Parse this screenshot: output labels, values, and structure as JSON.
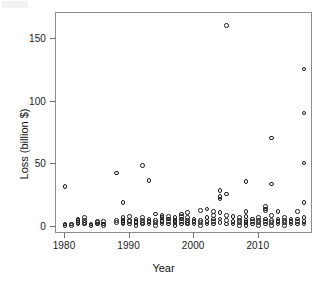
{
  "chart_data": {
    "type": "scatter",
    "title": "",
    "xlabel": "Year",
    "ylabel": "Loss (billion $)",
    "xlim": [
      1978.6,
      2018.4
    ],
    "ylim": [
      -6,
      171
    ],
    "xticks": [
      1980,
      1990,
      2000,
      2010
    ],
    "yticks": [
      0,
      50,
      100,
      150
    ],
    "xticklabels": [
      "1980",
      "1990",
      "2000",
      "2010"
    ],
    "yticklabels": [
      "0",
      "50",
      "100",
      "150"
    ],
    "grid": false,
    "legend": null,
    "marker": "open-circle",
    "marker_color": "#1c1c1c",
    "points": [
      {
        "x": 1980,
        "y": 32
      },
      {
        "x": 1980,
        "y": 2
      },
      {
        "x": 1980,
        "y": 1
      },
      {
        "x": 1981,
        "y": 2
      },
      {
        "x": 1981,
        "y": 1
      },
      {
        "x": 1982,
        "y": 3
      },
      {
        "x": 1982,
        "y": 2
      },
      {
        "x": 1982,
        "y": 6
      },
      {
        "x": 1982,
        "y": 5
      },
      {
        "x": 1983,
        "y": 7
      },
      {
        "x": 1983,
        "y": 5
      },
      {
        "x": 1983,
        "y": 3
      },
      {
        "x": 1983,
        "y": 2
      },
      {
        "x": 1984,
        "y": 2
      },
      {
        "x": 1984,
        "y": 1
      },
      {
        "x": 1985,
        "y": 4
      },
      {
        "x": 1985,
        "y": 3
      },
      {
        "x": 1985,
        "y": 2
      },
      {
        "x": 1986,
        "y": 4
      },
      {
        "x": 1986,
        "y": 2
      },
      {
        "x": 1986,
        "y": 1
      },
      {
        "x": 1988,
        "y": 43
      },
      {
        "x": 1988,
        "y": 5
      },
      {
        "x": 1988,
        "y": 3
      },
      {
        "x": 1989,
        "y": 19
      },
      {
        "x": 1989,
        "y": 7
      },
      {
        "x": 1989,
        "y": 5
      },
      {
        "x": 1989,
        "y": 3
      },
      {
        "x": 1989,
        "y": 2
      },
      {
        "x": 1990,
        "y": 8
      },
      {
        "x": 1990,
        "y": 5
      },
      {
        "x": 1990,
        "y": 4
      },
      {
        "x": 1990,
        "y": 2
      },
      {
        "x": 1991,
        "y": 6
      },
      {
        "x": 1991,
        "y": 4
      },
      {
        "x": 1991,
        "y": 3
      },
      {
        "x": 1991,
        "y": 1
      },
      {
        "x": 1992,
        "y": 49
      },
      {
        "x": 1992,
        "y": 7
      },
      {
        "x": 1992,
        "y": 5
      },
      {
        "x": 1992,
        "y": 3
      },
      {
        "x": 1992,
        "y": 2
      },
      {
        "x": 1993,
        "y": 37
      },
      {
        "x": 1993,
        "y": 6
      },
      {
        "x": 1993,
        "y": 4
      },
      {
        "x": 1993,
        "y": 2
      },
      {
        "x": 1994,
        "y": 10
      },
      {
        "x": 1994,
        "y": 5
      },
      {
        "x": 1994,
        "y": 3
      },
      {
        "x": 1994,
        "y": 1
      },
      {
        "x": 1995,
        "y": 9
      },
      {
        "x": 1995,
        "y": 7
      },
      {
        "x": 1995,
        "y": 5
      },
      {
        "x": 1995,
        "y": 4
      },
      {
        "x": 1995,
        "y": 2
      },
      {
        "x": 1996,
        "y": 8
      },
      {
        "x": 1996,
        "y": 6
      },
      {
        "x": 1996,
        "y": 4
      },
      {
        "x": 1996,
        "y": 2
      },
      {
        "x": 1997,
        "y": 7
      },
      {
        "x": 1997,
        "y": 5
      },
      {
        "x": 1997,
        "y": 3
      },
      {
        "x": 1997,
        "y": 1
      },
      {
        "x": 1998,
        "y": 10
      },
      {
        "x": 1998,
        "y": 8
      },
      {
        "x": 1998,
        "y": 6
      },
      {
        "x": 1998,
        "y": 4
      },
      {
        "x": 1998,
        "y": 2
      },
      {
        "x": 1999,
        "y": 11
      },
      {
        "x": 1999,
        "y": 7
      },
      {
        "x": 1999,
        "y": 5
      },
      {
        "x": 1999,
        "y": 3
      },
      {
        "x": 1999,
        "y": 2
      },
      {
        "x": 2000,
        "y": 6
      },
      {
        "x": 2000,
        "y": 4
      },
      {
        "x": 2000,
        "y": 2
      },
      {
        "x": 2001,
        "y": 13
      },
      {
        "x": 2001,
        "y": 5
      },
      {
        "x": 2001,
        "y": 3
      },
      {
        "x": 2001,
        "y": 1
      },
      {
        "x": 2002,
        "y": 14
      },
      {
        "x": 2002,
        "y": 7
      },
      {
        "x": 2002,
        "y": 4
      },
      {
        "x": 2002,
        "y": 2
      },
      {
        "x": 2003,
        "y": 12
      },
      {
        "x": 2003,
        "y": 9
      },
      {
        "x": 2003,
        "y": 6
      },
      {
        "x": 2003,
        "y": 4
      },
      {
        "x": 2003,
        "y": 2
      },
      {
        "x": 2004,
        "y": 29
      },
      {
        "x": 2004,
        "y": 24
      },
      {
        "x": 2004,
        "y": 22
      },
      {
        "x": 2004,
        "y": 11
      },
      {
        "x": 2004,
        "y": 6
      },
      {
        "x": 2004,
        "y": 3
      },
      {
        "x": 2005,
        "y": 161
      },
      {
        "x": 2005,
        "y": 26
      },
      {
        "x": 2005,
        "y": 9
      },
      {
        "x": 2005,
        "y": 5
      },
      {
        "x": 2005,
        "y": 2
      },
      {
        "x": 2006,
        "y": 8
      },
      {
        "x": 2006,
        "y": 4
      },
      {
        "x": 2006,
        "y": 2
      },
      {
        "x": 2007,
        "y": 7
      },
      {
        "x": 2007,
        "y": 5
      },
      {
        "x": 2007,
        "y": 3
      },
      {
        "x": 2007,
        "y": 1
      },
      {
        "x": 2008,
        "y": 36
      },
      {
        "x": 2008,
        "y": 12
      },
      {
        "x": 2008,
        "y": 8
      },
      {
        "x": 2008,
        "y": 5
      },
      {
        "x": 2008,
        "y": 3
      },
      {
        "x": 2008,
        "y": 1
      },
      {
        "x": 2009,
        "y": 6
      },
      {
        "x": 2009,
        "y": 4
      },
      {
        "x": 2009,
        "y": 2
      },
      {
        "x": 2010,
        "y": 7
      },
      {
        "x": 2010,
        "y": 5
      },
      {
        "x": 2010,
        "y": 3
      },
      {
        "x": 2010,
        "y": 1
      },
      {
        "x": 2011,
        "y": 16
      },
      {
        "x": 2011,
        "y": 14
      },
      {
        "x": 2011,
        "y": 13
      },
      {
        "x": 2011,
        "y": 6
      },
      {
        "x": 2011,
        "y": 4
      },
      {
        "x": 2011,
        "y": 2
      },
      {
        "x": 2012,
        "y": 71
      },
      {
        "x": 2012,
        "y": 34
      },
      {
        "x": 2012,
        "y": 9
      },
      {
        "x": 2012,
        "y": 5
      },
      {
        "x": 2012,
        "y": 3
      },
      {
        "x": 2012,
        "y": 1
      },
      {
        "x": 2013,
        "y": 12
      },
      {
        "x": 2013,
        "y": 6
      },
      {
        "x": 2013,
        "y": 4
      },
      {
        "x": 2013,
        "y": 2
      },
      {
        "x": 2014,
        "y": 7
      },
      {
        "x": 2014,
        "y": 5
      },
      {
        "x": 2014,
        "y": 3
      },
      {
        "x": 2014,
        "y": 1
      },
      {
        "x": 2015,
        "y": 6
      },
      {
        "x": 2015,
        "y": 4
      },
      {
        "x": 2015,
        "y": 2
      },
      {
        "x": 2016,
        "y": 12
      },
      {
        "x": 2016,
        "y": 6
      },
      {
        "x": 2016,
        "y": 4
      },
      {
        "x": 2016,
        "y": 2
      },
      {
        "x": 2017,
        "y": 126
      },
      {
        "x": 2017,
        "y": 91
      },
      {
        "x": 2017,
        "y": 51
      },
      {
        "x": 2017,
        "y": 19
      },
      {
        "x": 2017,
        "y": 7
      },
      {
        "x": 2017,
        "y": 4
      },
      {
        "x": 2017,
        "y": 2
      }
    ]
  }
}
